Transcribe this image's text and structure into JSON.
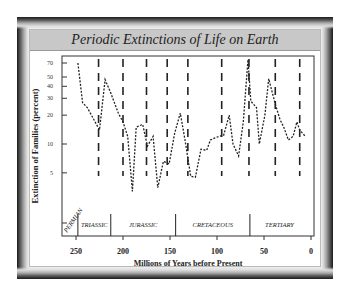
{
  "chart_data": {
    "type": "line",
    "title": "Periodic Extinctions of Life on Earth",
    "xlabel": "Millions of Years before Present",
    "ylabel": "Extinction of Families (percent)",
    "x_axis": {
      "reversed": true,
      "range": [
        265,
        0
      ],
      "ticks": [
        250,
        200,
        150,
        100,
        50,
        0
      ]
    },
    "y_axis": {
      "scale": "log",
      "tick_labels": [
        "70",
        "50",
        "40",
        "30",
        "20",
        "10",
        "5"
      ]
    },
    "grid": false,
    "legend": null,
    "series": [
      {
        "name": "Extinction percent",
        "style": "dotted",
        "x": [
          248,
          243,
          238,
          225,
          219,
          213,
          205,
          200,
          195,
          190,
          186,
          179,
          174,
          168,
          163,
          157,
          151,
          145,
          139,
          134,
          128,
          123,
          117,
          111,
          107,
          103,
          98,
          93,
          87,
          83,
          77,
          72,
          67,
          64,
          58,
          55,
          49,
          45,
          38,
          33,
          29,
          24,
          19,
          15,
          12,
          6
        ],
        "values": [
          70,
          27,
          24,
          14,
          47,
          34,
          21,
          17,
          12,
          3.2,
          15,
          16,
          9.5,
          12,
          3.5,
          6.6,
          6.2,
          13,
          21,
          11,
          4.6,
          4.5,
          8.8,
          8.6,
          11,
          11.5,
          12,
          12.3,
          20,
          10,
          7.5,
          17,
          76,
          28,
          24,
          10,
          20,
          48,
          26,
          18,
          15,
          11,
          12,
          17,
          14,
          12
        ]
      }
    ],
    "periodic_lines_my": [
      226,
      200,
      175,
      153,
      131,
      95,
      66,
      38,
      12
    ],
    "geologic_periods": [
      {
        "name": "PERMIAN",
        "start": 265,
        "end": 248
      },
      {
        "name": "TRIASSIC",
        "start": 248,
        "end": 213
      },
      {
        "name": "JURASSIC",
        "start": 213,
        "end": 144
      },
      {
        "name": "CRETACEOUS",
        "start": 144,
        "end": 65
      },
      {
        "name": "TERTIARY",
        "start": 65,
        "end": 2
      }
    ]
  },
  "colors": {
    "frame_dark": "#1a1a1a",
    "title_bar": "#c8c8c8",
    "line": "#222222",
    "background": "#ffffff"
  }
}
